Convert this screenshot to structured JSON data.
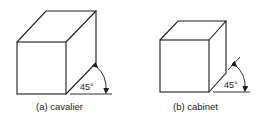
{
  "figures": [
    {
      "id": "cavalier",
      "caption": "(a) cavalier",
      "angle_label": "45°"
    },
    {
      "id": "cabinet",
      "caption": "(b) cabinet",
      "angle_label": "45°"
    }
  ],
  "colors": {
    "line": "#1a1a1a",
    "background": "#ffffff"
  }
}
